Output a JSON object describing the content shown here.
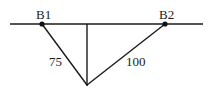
{
  "diagram": {
    "type": "geometry",
    "background": "#ffffff",
    "stroke_color": "#1a1a1a",
    "baseline": {
      "x1": 10,
      "y1": 24,
      "x2": 203,
      "y2": 24
    },
    "points": [
      {
        "id": "B1",
        "label": "B1",
        "x": 42,
        "y": 24
      },
      {
        "id": "B2",
        "label": "B2",
        "x": 165,
        "y": 24
      }
    ],
    "apex": {
      "x": 87,
      "y": 85
    },
    "perpendicular": {
      "x": 87,
      "y1": 24,
      "y2": 85
    },
    "segments": [
      {
        "from": "B1",
        "to": "apex",
        "length_label": "75"
      },
      {
        "from": "B2",
        "to": "apex",
        "length_label": "100"
      }
    ]
  }
}
